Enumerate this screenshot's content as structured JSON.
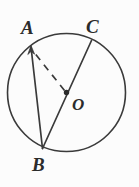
{
  "figure": {
    "type": "circle-geometry-diagram",
    "background_color": "#fcfcfc",
    "stroke_color": "#3a3a3a",
    "label_color": "#2b2b2b",
    "circle": {
      "center_label": "O",
      "center_x": 66.5,
      "center_y": 92.5,
      "radius": 59.5,
      "stroke_width": 1.6
    },
    "points": [
      {
        "id": "A",
        "label": "A",
        "x": 31,
        "y": 47,
        "on_circle": true
      },
      {
        "id": "C",
        "label": "C",
        "x": 91.5,
        "y": 40.5,
        "on_circle": true
      },
      {
        "id": "B",
        "label": "B",
        "x": 42.5,
        "y": 148.5,
        "on_circle": true
      },
      {
        "id": "O",
        "label": "O",
        "x": 66.5,
        "y": 92.5,
        "on_circle": false
      }
    ],
    "segments": [
      {
        "id": "AB",
        "from": "A",
        "to": "B",
        "style": "solid",
        "arrow": false,
        "note": "chord"
      },
      {
        "id": "BC",
        "from": "B",
        "to": "C",
        "style": "solid",
        "arrow": false,
        "note": "diameter through O"
      },
      {
        "id": "OA",
        "from": "O",
        "to": "A",
        "style": "dashed",
        "arrow": true,
        "note": "radius with arrowhead at A"
      }
    ],
    "center_dot": {
      "x": 66.5,
      "y": 92.5,
      "radius": 2.6
    },
    "labels": {
      "A": "A",
      "C": "C",
      "O": "O",
      "B": "B"
    }
  }
}
